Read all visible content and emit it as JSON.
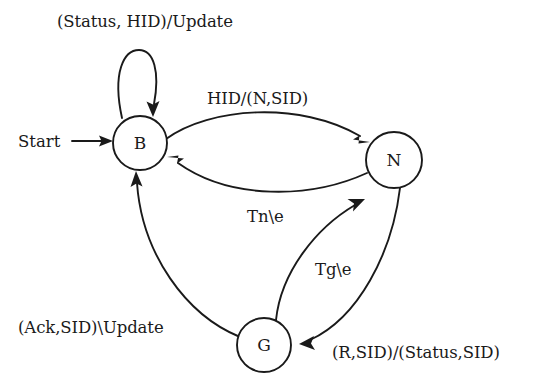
{
  "diagram": {
    "background_color": "#ffffff",
    "stroke_color": "#1a1a1a",
    "start_label": "Start",
    "nodes": [
      {
        "id": "B",
        "label": "B",
        "cx": 140,
        "cy": 143,
        "r": 27
      },
      {
        "id": "N",
        "label": "N",
        "cx": 394,
        "cy": 160,
        "r": 28
      },
      {
        "id": "G",
        "label": "G",
        "cx": 264,
        "cy": 345,
        "r": 27
      }
    ],
    "edges": [
      {
        "id": "b-self",
        "from": "B",
        "to": "B",
        "label": "(Status, HID)/Update"
      },
      {
        "id": "b-to-n",
        "from": "B",
        "to": "N",
        "label": "HID/(N,SID)"
      },
      {
        "id": "n-to-b",
        "from": "N",
        "to": "B",
        "label": "Tn\\e"
      },
      {
        "id": "g-to-n",
        "from": "G",
        "to": "N",
        "label": "Tg\\e"
      },
      {
        "id": "n-to-g",
        "from": "N",
        "to": "G",
        "label": "(R,SID)/(Status,SID)"
      },
      {
        "id": "g-to-b",
        "from": "G",
        "to": "B",
        "label": "(Ack,SID)\\Update"
      }
    ]
  }
}
